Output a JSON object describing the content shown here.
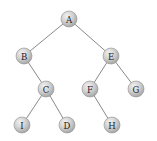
{
  "diagram": {
    "type": "binary-tree",
    "node_radius": 8,
    "colors": {
      "node_fill_light": "#e6e6e6",
      "node_fill_dark": "#a9a9a9",
      "node_stroke": "#8f8f8f",
      "edge": "#7a7a7a",
      "label": "#222222",
      "background": "#ffffff"
    },
    "nodes": [
      {
        "id": "A",
        "label": "A",
        "x": 69,
        "y": 19
      },
      {
        "id": "B",
        "label": "B",
        "x": 24,
        "y": 56
      },
      {
        "id": "E",
        "label": "E",
        "x": 111,
        "y": 56
      },
      {
        "id": "C",
        "label": "C",
        "x": 46,
        "y": 89
      },
      {
        "id": "F",
        "label": "F",
        "x": 90,
        "y": 89
      },
      {
        "id": "G",
        "label": "G",
        "x": 136,
        "y": 89
      },
      {
        "id": "I",
        "label": "I",
        "x": 22,
        "y": 125
      },
      {
        "id": "D",
        "label": "D",
        "x": 67,
        "y": 125
      },
      {
        "id": "H",
        "label": "H",
        "x": 112,
        "y": 125
      }
    ],
    "edges": [
      {
        "from": "A",
        "to": "B"
      },
      {
        "from": "A",
        "to": "E"
      },
      {
        "from": "B",
        "to": "C"
      },
      {
        "from": "C",
        "to": "I"
      },
      {
        "from": "C",
        "to": "D"
      },
      {
        "from": "E",
        "to": "F"
      },
      {
        "from": "E",
        "to": "G"
      },
      {
        "from": "F",
        "to": "H"
      }
    ]
  }
}
